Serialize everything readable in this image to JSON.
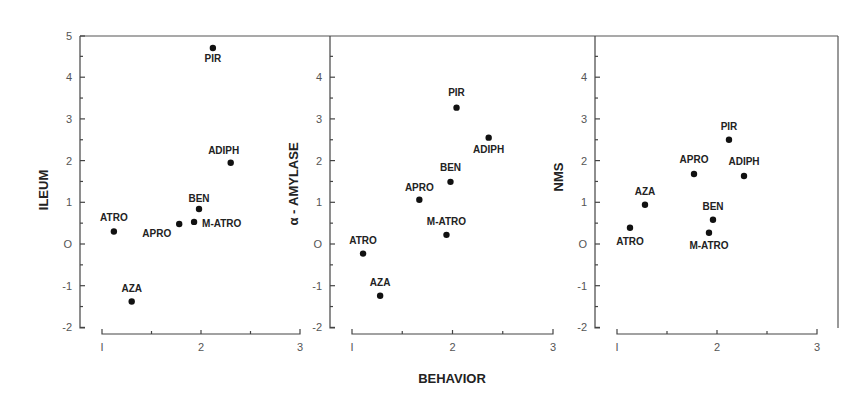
{
  "chart_data": [
    {
      "type": "scatter",
      "panel": 1,
      "title": "",
      "xlabel": "",
      "ylabel": "ILEUM",
      "xlim": [
        1,
        3
      ],
      "ylim": [
        -2,
        5
      ],
      "x_ticks": [
        "1",
        "2",
        "3"
      ],
      "y_ticks": [
        "-2",
        "-1",
        "0",
        "1",
        "2",
        "3",
        "4",
        "5"
      ],
      "grid": false,
      "points": [
        {
          "label": "PIR",
          "x": 2.12,
          "y": 4.7
        },
        {
          "label": "ADIPH",
          "x": 2.3,
          "y": 1.95
        },
        {
          "label": "BEN",
          "x": 1.98,
          "y": 0.84
        },
        {
          "label": "M-ATRO",
          "x": 1.93,
          "y": 0.53
        },
        {
          "label": "APRO",
          "x": 1.78,
          "y": 0.48
        },
        {
          "label": "ATRO",
          "x": 1.12,
          "y": 0.3
        },
        {
          "label": "AZA",
          "x": 1.3,
          "y": -1.38
        }
      ]
    },
    {
      "type": "scatter",
      "panel": 2,
      "title": "",
      "xlabel": "BEHAVIOR",
      "ylabel": "α - AMYLASE",
      "xlim": [
        1,
        3
      ],
      "ylim": [
        -2,
        5
      ],
      "x_ticks": [
        "1",
        "2",
        "3"
      ],
      "y_ticks": [
        "-2",
        "-1",
        "0",
        "1",
        "2",
        "3",
        "4"
      ],
      "grid": false,
      "points": [
        {
          "label": "PIR",
          "x": 2.04,
          "y": 3.27
        },
        {
          "label": "ADIPH",
          "x": 2.36,
          "y": 2.55
        },
        {
          "label": "BEN",
          "x": 1.98,
          "y": 1.49
        },
        {
          "label": "APRO",
          "x": 1.67,
          "y": 1.06
        },
        {
          "label": "M-ATRO",
          "x": 1.94,
          "y": 0.22
        },
        {
          "label": "ATRO",
          "x": 1.11,
          "y": -0.23
        },
        {
          "label": "AZA",
          "x": 1.28,
          "y": -1.24
        }
      ]
    },
    {
      "type": "scatter",
      "panel": 3,
      "title": "",
      "xlabel": "",
      "ylabel": "NMS",
      "xlim": [
        1,
        3
      ],
      "ylim": [
        -2,
        5
      ],
      "x_ticks": [
        "1",
        "2",
        "3"
      ],
      "y_ticks": [
        "-2",
        "-1",
        "0",
        "1",
        "2",
        "3",
        "4"
      ],
      "grid": false,
      "points": [
        {
          "label": "PIR",
          "x": 2.12,
          "y": 2.5
        },
        {
          "label": "ADIPH",
          "x": 2.27,
          "y": 1.63
        },
        {
          "label": "APRO",
          "x": 1.77,
          "y": 1.68
        },
        {
          "label": "AZA",
          "x": 1.28,
          "y": 0.94
        },
        {
          "label": "BEN",
          "x": 1.96,
          "y": 0.58
        },
        {
          "label": "ATRO",
          "x": 1.13,
          "y": 0.39
        },
        {
          "label": "M-ATRO",
          "x": 1.92,
          "y": 0.27
        }
      ]
    }
  ],
  "labels": {
    "shared_xlabel": "BEHAVIOR",
    "panel1_ylabel": "ILEUM",
    "panel2_ylabel": "α - AMYLASE",
    "panel3_ylabel": "NMS"
  }
}
